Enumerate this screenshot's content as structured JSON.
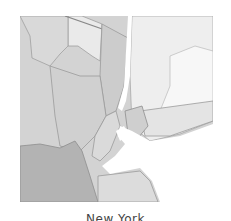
{
  "map": {
    "region": "New York metropolitan area",
    "colors": {
      "background": "#f2f2f2",
      "land_light": "#e9e9e9",
      "land_mid": "#cfcfcf",
      "land_midlight": "#d8d8d8",
      "land_dark": "#b3b3b3",
      "water": "#ffffff",
      "border": "#9a9a9a",
      "state_line": "#8a8a8a"
    }
  },
  "caption": {
    "label": "New York"
  }
}
